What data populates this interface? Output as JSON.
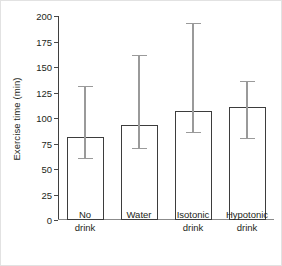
{
  "chart_data": {
    "type": "bar",
    "title": "",
    "xlabel": "",
    "ylabel": "Exercise time (min)",
    "categories": [
      "No drink",
      "Water",
      "Isotonic drink",
      "Hypotonic drink"
    ],
    "values": [
      81,
      93,
      107,
      111
    ],
    "errors_upper": [
      131,
      162,
      193,
      136
    ],
    "errors_lower": [
      61,
      71,
      86,
      80
    ],
    "yticks": [
      0,
      25,
      50,
      75,
      100,
      125,
      150,
      175,
      200
    ],
    "ytick_labels": [
      "0",
      "25",
      "50",
      "75",
      "100",
      "125",
      "150",
      "175",
      "200"
    ],
    "ylim": [
      0,
      200
    ],
    "grid": false,
    "legend": null,
    "series": [
      {
        "name": "Exercise time",
        "values": [
          81,
          93,
          107,
          111
        ]
      }
    ],
    "colors": {
      "bar_fill": "#ffffff",
      "bar_edge": "#3d3d3d",
      "error_bar": "#9a9a9a",
      "axis": "#4a4a4a",
      "text": "#231f20"
    }
  }
}
